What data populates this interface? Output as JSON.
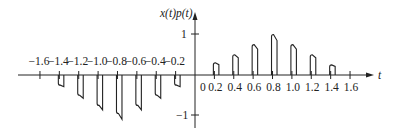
{
  "figure": {
    "y_axis_label": "x(t)p(t)",
    "x_axis_label": "t",
    "y_ticks": [
      {
        "value": 1,
        "label": "1"
      },
      {
        "value": -1,
        "label": "−1"
      }
    ],
    "x_ticks_negative": [
      "−1.6",
      "−1.4",
      "−1.2",
      "−1.0",
      "−0.8",
      "−0.6",
      "−0.4",
      "−0.2"
    ],
    "x_ticks_positive": [
      "0",
      "0.2",
      "0.4",
      "0.6",
      "0.8",
      "1.0",
      "1.2",
      "1.4",
      "1.6"
    ]
  },
  "chart_data": {
    "type": "bar",
    "title": "",
    "xlabel": "t",
    "ylabel": "x(t)p(t)",
    "x": [
      -1.4,
      -1.2,
      -1.0,
      -0.8,
      -0.6,
      -0.4,
      -0.2,
      0.2,
      0.4,
      0.6,
      0.8,
      1.0,
      1.2,
      1.4
    ],
    "values": [
      -0.25,
      -0.5,
      -0.75,
      -0.95,
      -0.75,
      -0.5,
      -0.25,
      0.3,
      0.5,
      0.75,
      1.0,
      0.75,
      0.5,
      0.25
    ],
    "xlim": [
      -1.6,
      1.6
    ],
    "ylim": [
      -1,
      1
    ],
    "grid": false,
    "legend": null
  }
}
